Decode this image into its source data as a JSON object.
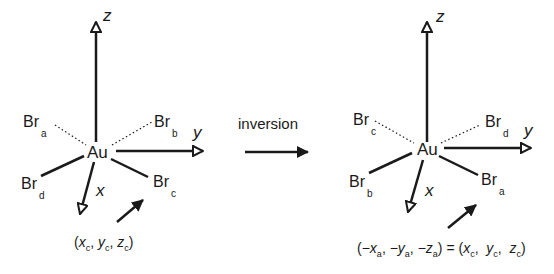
{
  "arrow_label": "inversion",
  "left": {
    "center": "Au",
    "axes": {
      "z": "z",
      "y": "y",
      "x": "x"
    },
    "ligands": {
      "upper_left": {
        "el": "Br",
        "sub": "a"
      },
      "upper_right": {
        "el": "Br",
        "sub": "b"
      },
      "lower_right": {
        "el": "Br",
        "sub": "c"
      },
      "lower_left": {
        "el": "Br",
        "sub": "d"
      }
    },
    "coord": {
      "open": "(",
      "x": "x",
      "xs": "c",
      "y": "y",
      "ys": "c",
      "z": "z",
      "zs": "c",
      "close": ")"
    }
  },
  "right": {
    "center": "Au",
    "axes": {
      "z": "z",
      "y": "y",
      "x": "x"
    },
    "ligands": {
      "upper_left": {
        "el": "Br",
        "sub": "c"
      },
      "upper_right": {
        "el": "Br",
        "sub": "d"
      },
      "lower_right": {
        "el": "Br",
        "sub": "a"
      },
      "lower_left": {
        "el": "Br",
        "sub": "b"
      }
    },
    "coord": {
      "lhs_x": "−x",
      "lhs_xs": "a",
      "lhs_y": "−y",
      "lhs_ys": "a",
      "lhs_z": "−z",
      "lhs_zs": "a",
      "eq": "=",
      "rhs_x": "x",
      "rhs_xs": "c",
      "rhs_y": "y",
      "rhs_ys": "c",
      "rhs_z": "z",
      "rhs_zs": "c"
    }
  }
}
